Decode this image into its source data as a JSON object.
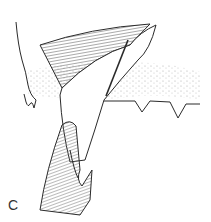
{
  "figure": {
    "panel_label": "C",
    "colors": {
      "line": "#2a2a2a",
      "hatch": "#555555",
      "stipple": "#b5b5b5",
      "background": "#ffffff"
    }
  }
}
